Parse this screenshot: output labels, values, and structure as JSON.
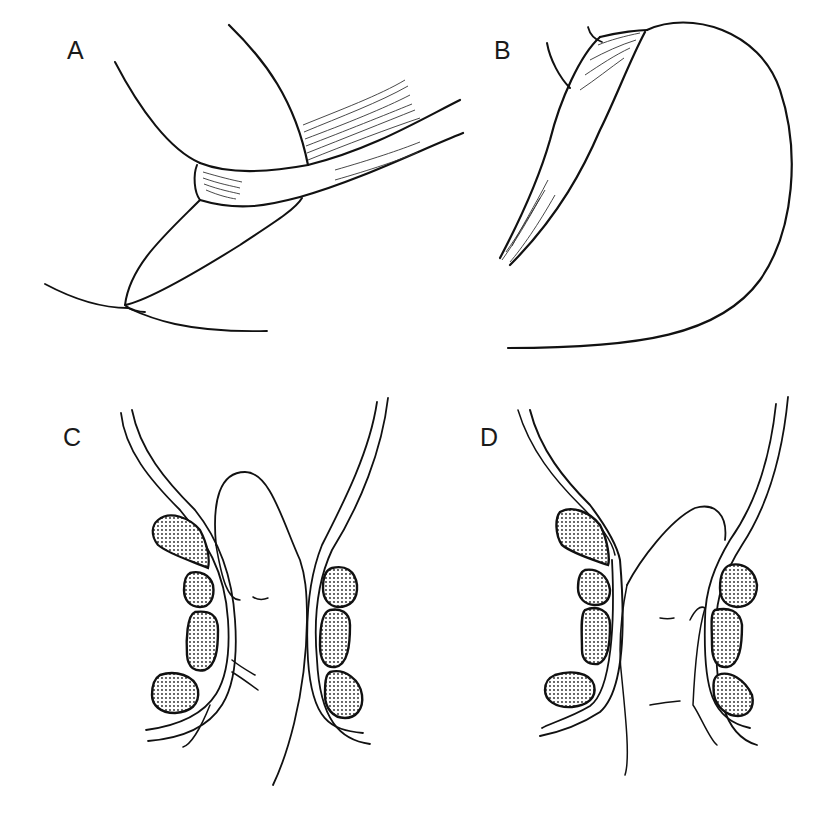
{
  "figure": {
    "background": "#ffffff",
    "ink_color": "#111111",
    "panels": [
      {
        "id": "A",
        "label": "A"
      },
      {
        "id": "B",
        "label": "B"
      },
      {
        "id": "C",
        "label": "C"
      },
      {
        "id": "D",
        "label": "D"
      }
    ]
  }
}
